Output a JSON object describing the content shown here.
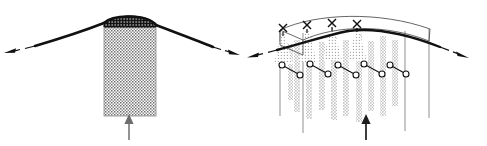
{
  "figure": {
    "title": "",
    "background_color": "#ffffff",
    "width": 487,
    "height": 146,
    "panel_count": 2
  },
  "colors": {
    "stroke_dark": "#111111",
    "stroke_mid": "#444444",
    "stroke_light": "#9a9a9a",
    "stipple": "#6f6f6f",
    "stipple_light": "#b0b0b0",
    "crest_fill": "#1a1a1a",
    "column_fill": "#cfcfcf",
    "white": "#ffffff"
  },
  "panels": [
    {
      "id": "panel-left",
      "name": "unsuppressed-plume-panel",
      "caption": "",
      "elements": {
        "plume_column": {
          "name": "stippled-plume-column",
          "label": "",
          "x": 104,
          "y": 22,
          "width": 52,
          "height": 94,
          "texture": "dotted-stipple"
        },
        "crest": {
          "name": "plume-crest-cap",
          "label": "",
          "description": "dark stippled dome atop column"
        },
        "interface_line": {
          "name": "inversion-interface-line",
          "label": "",
          "description": "thick bowed line rising to crest then falling both ways"
        },
        "arrow_left": {
          "name": "outflow-arrow-left",
          "label": "",
          "direction": "down-left",
          "style": "dashed-gap-head"
        },
        "arrow_right": {
          "name": "outflow-arrow-right",
          "label": "",
          "direction": "down-right",
          "style": "dashed-gap-head"
        },
        "arrow_bottom": {
          "name": "source-inflow-arrow",
          "label": "",
          "direction": "up",
          "style": "gray-shaft"
        }
      }
    },
    {
      "id": "panel-right",
      "name": "suppressed-plume-panel",
      "caption": "",
      "elements": {
        "frame_box": {
          "name": "perspective-frame-box",
          "label": "",
          "description": "thin 3D wireframe canopy box in perspective"
        },
        "canopy_curve_back": {
          "name": "canopy-curve-back",
          "label": "",
          "description": "thin upper arc of canopy"
        },
        "canopy_curve_front": {
          "name": "canopy-curve-front",
          "label": "",
          "description": "thin lower arc of canopy"
        },
        "interface_line": {
          "name": "inversion-interface-line",
          "label": "",
          "description": "thick bowed line crossing the canopy"
        },
        "nozzles": {
          "name": "spray-nozzle-group",
          "label": "",
          "count": 4,
          "glyph": "x-cross",
          "positions_x": [
            283,
            307,
            331,
            355
          ]
        },
        "spray_cones": {
          "name": "spray-cone-group",
          "label": "",
          "count": 4,
          "texture": "stipple-cone"
        },
        "droplet_streams": {
          "name": "droplet-stream-group",
          "label": "",
          "count": 10,
          "texture": "dotted-stream"
        },
        "dumbbells": {
          "name": "droplet-pair-group",
          "label": "",
          "count": 5,
          "glyph": "circle-line-circle",
          "description": "open circle joined by short line to second open circle, tilted down-right"
        },
        "posts": {
          "name": "support-post-group",
          "label": "",
          "count": 4,
          "color": "#9a9a9a"
        },
        "arrow_left": {
          "name": "outflow-arrow-left",
          "label": "",
          "direction": "down-left",
          "style": "dashed-gap-head"
        },
        "arrow_right": {
          "name": "outflow-arrow-right",
          "label": "",
          "direction": "down-right",
          "style": "dashed-gap-head"
        },
        "arrow_bottom": {
          "name": "source-inflow-arrow",
          "label": "",
          "direction": "up",
          "style": "dark-shaft"
        }
      }
    }
  ]
}
